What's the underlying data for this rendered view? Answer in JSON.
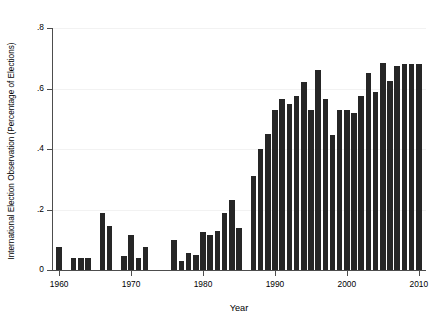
{
  "chart_data": {
    "type": "bar",
    "title": "",
    "subtitle": "",
    "xlabel": "Year",
    "ylabel": "International Election Observation (Percentage of Elections)",
    "xlim": [
      1959,
      2011
    ],
    "ylim": [
      0,
      0.8
    ],
    "grid": true,
    "legend": null,
    "xticks": [
      1960,
      1970,
      1980,
      1990,
      2000,
      2010
    ],
    "xticklabels": [
      "1960",
      "1970",
      "1980",
      "1990",
      "2000",
      "2010"
    ],
    "yticks": [
      0,
      0.2,
      0.4,
      0.6,
      0.8
    ],
    "yticklabels": [
      "0",
      ".2",
      ".4",
      ".6",
      ".8"
    ],
    "bar_color": "#262626",
    "categories": [
      1960,
      1961,
      1962,
      1963,
      1964,
      1965,
      1966,
      1967,
      1968,
      1969,
      1970,
      1971,
      1972,
      1973,
      1974,
      1975,
      1976,
      1977,
      1978,
      1979,
      1980,
      1981,
      1982,
      1983,
      1984,
      1985,
      1986,
      1987,
      1988,
      1989,
      1990,
      1991,
      1992,
      1993,
      1994,
      1995,
      1996,
      1997,
      1998,
      1999,
      2000,
      2001,
      2002,
      2003,
      2004,
      2005,
      2006,
      2007,
      2008,
      2009,
      2010
    ],
    "values": [
      0.075,
      0.0,
      0.04,
      0.04,
      0.04,
      0.0,
      0.19,
      0.145,
      0.0,
      0.045,
      0.115,
      0.04,
      0.075,
      0.0,
      0.0,
      0.0,
      0.1,
      0.03,
      0.055,
      0.05,
      0.125,
      0.115,
      0.13,
      0.19,
      0.23,
      0.14,
      0.0,
      0.31,
      0.4,
      0.45,
      0.53,
      0.565,
      0.55,
      0.575,
      0.62,
      0.53,
      0.66,
      0.565,
      0.445,
      0.53,
      0.53,
      0.52,
      0.575,
      0.65,
      0.59,
      0.685,
      0.625,
      0.675,
      0.68,
      0.68,
      0.68
    ]
  }
}
